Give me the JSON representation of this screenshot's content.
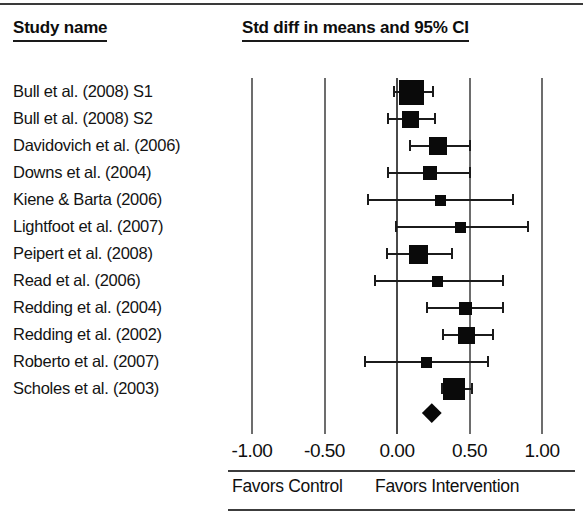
{
  "header": {
    "study_column_label": "Study name",
    "statistic_column_label": "Std diff in means and 95% CI"
  },
  "axis": {
    "tick_labels": [
      "-1.00",
      "-0.50",
      "0.00",
      "0.50",
      "1.00"
    ],
    "favors_left_label": "Favors Control",
    "favors_right_label": "Favors Intervention"
  },
  "chart_data": {
    "type": "forest",
    "title": "Std diff in means and 95% CI",
    "xlabel": "Std diff in means",
    "ylabel": "Study name",
    "xlim": [
      -1.25,
      1.25
    ],
    "xticks": [
      -1.0,
      -0.5,
      0.0,
      0.5,
      1.0
    ],
    "xtick_labels": [
      "-1.00",
      "-0.50",
      "0.00",
      "0.50",
      "1.00"
    ],
    "grid": true,
    "legend": null,
    "effect_measure": "Std diff in means",
    "null_line": 0.0,
    "favors_left": "Favors Control",
    "favors_right": "Favors Intervention",
    "categories": [
      "Bull et al. (2008) S1",
      "Bull et al. (2008) S2",
      "Davidovich et al. (2006)",
      "Downs et al. (2004)",
      "Kiene & Barta (2006)",
      "Lightfoot et al. (2007)",
      "Peipert et al. (2008)",
      "Read et al. (2006)",
      "Redding et al. (2004)",
      "Redding et al. (2002)",
      "Roberto et al. (2007)",
      "Scholes et al. (2003)"
    ],
    "studies": [
      {
        "name": "Bull et al. (2008) S1",
        "estimate": 0.1,
        "lower": -0.02,
        "upper": 0.25,
        "weight": 25
      },
      {
        "name": "Bull et al. (2008) S2",
        "estimate": 0.09,
        "lower": -0.06,
        "upper": 0.26,
        "weight": 17
      },
      {
        "name": "Davidovich et al. (2006)",
        "estimate": 0.28,
        "lower": 0.09,
        "upper": 0.5,
        "weight": 18
      },
      {
        "name": "Downs et al. (2004)",
        "estimate": 0.23,
        "lower": -0.06,
        "upper": 0.5,
        "weight": 14
      },
      {
        "name": "Kiene & Barta (2006)",
        "estimate": 0.3,
        "lower": -0.2,
        "upper": 0.8,
        "weight": 11
      },
      {
        "name": "Lightfoot et al. (2007)",
        "estimate": 0.44,
        "lower": -0.01,
        "upper": 0.9,
        "weight": 11
      },
      {
        "name": "Peipert et al. (2008)",
        "estimate": 0.15,
        "lower": -0.07,
        "upper": 0.38,
        "weight": 19
      },
      {
        "name": "Read et al. (2006)",
        "estimate": 0.28,
        "lower": -0.15,
        "upper": 0.73,
        "weight": 11
      },
      {
        "name": "Redding et al. (2004)",
        "estimate": 0.47,
        "lower": 0.21,
        "upper": 0.73,
        "weight": 13
      },
      {
        "name": "Redding et al. (2002)",
        "estimate": 0.48,
        "lower": 0.32,
        "upper": 0.66,
        "weight": 17
      },
      {
        "name": "Roberto et al. (2007)",
        "estimate": 0.2,
        "lower": -0.22,
        "upper": 0.63,
        "weight": 11
      },
      {
        "name": "Scholes et al. (2003)",
        "estimate": 0.39,
        "lower": 0.31,
        "upper": 0.52,
        "weight": 22
      }
    ],
    "summary": {
      "label": "Overall",
      "estimate": 0.24,
      "lower": 0.18,
      "upper": 0.31,
      "shape": "diamond"
    }
  },
  "colors": {
    "marker": "#0a0a0a",
    "line": "#1b1b1b",
    "grid": "#6d6d6d",
    "text": "#111111",
    "background": "#ffffff"
  }
}
